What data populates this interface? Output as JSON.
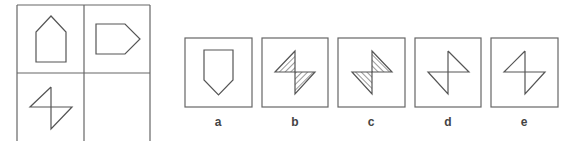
{
  "puzzle": {
    "matrix": {
      "cells": [
        {
          "position": "top-left",
          "shape": "pentagon-pointing-up"
        },
        {
          "position": "top-right",
          "shape": "pentagon-pointing-right"
        },
        {
          "position": "bottom-left",
          "shape": "double-triangle-z-outline"
        },
        {
          "position": "bottom-right",
          "shape": "empty"
        }
      ]
    },
    "options": [
      {
        "label": "a",
        "shape": "pentagon-pointing-down"
      },
      {
        "label": "b",
        "shape": "double-triangle-z-hatched"
      },
      {
        "label": "c",
        "shape": "double-triangle-s-hatched"
      },
      {
        "label": "d",
        "shape": "double-triangle-s-outline"
      },
      {
        "label": "e",
        "shape": "double-triangle-z-outline"
      }
    ],
    "colors": {
      "line": "#555555",
      "background": "#ffffff"
    }
  }
}
